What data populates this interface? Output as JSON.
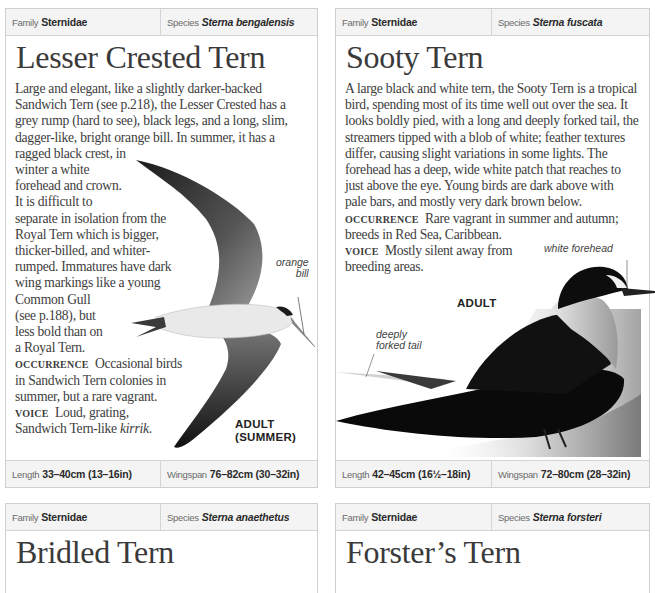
{
  "cards": [
    {
      "family_label": "Family",
      "family": "Sternidae",
      "species_label": "Species",
      "species": "Sterna bengalensis",
      "title": "Lesser Crested Tern",
      "description_lines": [
        "Large and elegant, like a slightly darker-backed",
        "Sandwich Tern (see p.218), the Lesser Crested has a",
        "grey rump (hard to see), black legs, and a long, slim,",
        "dagger-like, bright orange bill. In summer, it has a",
        "ragged black crest, in",
        "winter a white",
        "forehead and crown.",
        "It is difficult to",
        "separate in isolation from the",
        "Royal Tern which is bigger,",
        "thicker-billed, and whiter-",
        "rumped. Immatures have dark",
        "wing markings like a young",
        "Common Gull",
        "(see p.188), but",
        "less bold than on",
        "a Royal Tern."
      ],
      "occurrence_label": "OCCURRENCE",
      "occurrence_lines": [
        "Occasional birds",
        "in Sandwich Tern colonies in",
        "summer, but a rare vagrant."
      ],
      "voice_label": "VOICE",
      "voice_lines": [
        "Loud, grating,",
        "Sandwich Tern-like "
      ],
      "voice_call": "kirrik",
      "voice_end": ".",
      "callouts": [
        "orange",
        "bill"
      ],
      "caption_lines": [
        "ADULT",
        "(SUMMER)"
      ],
      "length_label": "Length",
      "length": "33–40cm (13–16in)",
      "wingspan_label": "Wingspan",
      "wingspan": "76–82cm (30–32in)"
    },
    {
      "family_label": "Family",
      "family": "Sternidae",
      "species_label": "Species",
      "species": "Sterna fuscata",
      "title": "Sooty Tern",
      "description_lines": [
        "A large black and white tern, the Sooty Tern is a tropical",
        "bird, spending most of its time well out over the sea. It",
        "looks boldly pied, with a long and deeply forked tail, the",
        "streamers tipped with a blob of white; feather textures",
        "differ, causing slight variations in some lights. The",
        "forehead has a deep, wide white patch that reaches to",
        "just above the eye. Young birds are dark above with",
        "pale bars, and mostly very dark brown below."
      ],
      "occurrence_label": "OCCURRENCE",
      "occurrence_lines": [
        "Rare vagrant in summer and autumn;",
        "breeds in Red Sea, Caribbean."
      ],
      "voice_label": "VOICE",
      "voice_lines": [
        "Mostly silent away from",
        "breeding areas."
      ],
      "callout_forehead": "white forehead",
      "callout_tail": [
        "deeply",
        "forked tail"
      ],
      "caption": "ADULT",
      "length_label": "Length",
      "length": "42–45cm (16½–18in)",
      "wingspan_label": "Wingspan",
      "wingspan": "72–80cm (28–32in)"
    },
    {
      "family_label": "Family",
      "family": "Sternidae",
      "species_label": "Species",
      "species": "Sterna anaethetus",
      "title": "Bridled Tern"
    },
    {
      "family_label": "Family",
      "family": "Sternidae",
      "species_label": "Species",
      "species": "Sterna forsteri",
      "title": "Forster’s Tern"
    }
  ]
}
